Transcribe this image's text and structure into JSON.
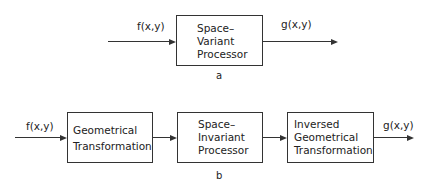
{
  "diagram_a": {
    "input_label": "f(x,y)",
    "output_label": "g(x,y)",
    "box": {
      "lines": [
        "Space–",
        "Variant",
        "Processor"
      ]
    },
    "caption": "a"
  },
  "diagram_b": {
    "input_label": "f(x,y)",
    "output_label": "g(x,y)",
    "boxes": [
      {
        "lines": [
          "Geometrical",
          "Transformation"
        ]
      },
      {
        "lines": [
          "Space–",
          "Invariant",
          "Processor"
        ]
      },
      {
        "lines": [
          "Inversed",
          "Geometrical",
          "Transformation"
        ]
      }
    ],
    "caption": "b"
  }
}
